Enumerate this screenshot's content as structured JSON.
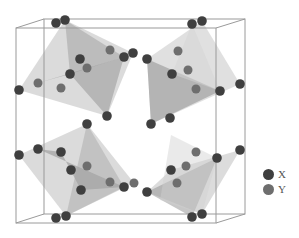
{
  "figure": {
    "type": "crystal-structure",
    "box": {
      "front": {
        "x1": 16,
        "y1": 28,
        "x2": 216,
        "y2": 223
      },
      "back": {
        "x1": 44,
        "y1": 19,
        "x2": 245,
        "y2": 214
      },
      "stroke": "#9a9a9a"
    },
    "polyhedra": [
      {
        "points": "65,20 133,53 107,116 19,90",
        "fill": "#bdbdbd",
        "opacity": 0.55
      },
      {
        "points": "65,20 124,57 70,74",
        "fill": "#9e9e9e",
        "opacity": 0.5
      },
      {
        "points": "38,83 124,57 107,116 70,74",
        "fill": "#8a8a8a",
        "opacity": 0.45
      },
      {
        "points": "202,21 240,84 151,124 147,59",
        "fill": "#c6c6c6",
        "opacity": 0.55
      },
      {
        "points": "147,59 220,91 151,124",
        "fill": "#8f8f8f",
        "opacity": 0.55
      },
      {
        "points": "192,24 220,91 172,74",
        "fill": "#d4d4d4",
        "opacity": 0.5
      },
      {
        "points": "87,124 134,183 66,216 19,155",
        "fill": "#bdbdbd",
        "opacity": 0.55
      },
      {
        "points": "38,149 124,187 81,190 61,152",
        "fill": "#8a8a8a",
        "opacity": 0.5
      },
      {
        "points": "87,124 124,187 66,216",
        "fill": "#a5a5a5",
        "opacity": 0.45
      },
      {
        "points": "171,170 240,150 202,214 147,192",
        "fill": "#c0c0c0",
        "opacity": 0.55
      },
      {
        "points": "147,192 217,158 192,217",
        "fill": "#8f8f8f",
        "opacity": 0.5
      },
      {
        "points": "171,135 217,158 202,214 160,200",
        "fill": "#d0d0d0",
        "opacity": 0.45
      }
    ],
    "atoms_x": [
      [
        56,
        23
      ],
      [
        65,
        20
      ],
      [
        80,
        59
      ],
      [
        70,
        74
      ],
      [
        19,
        90
      ],
      [
        124,
        57
      ],
      [
        133,
        53
      ],
      [
        107,
        116
      ],
      [
        147,
        59
      ],
      [
        172,
        74
      ],
      [
        220,
        91
      ],
      [
        240,
        84
      ],
      [
        151,
        124
      ],
      [
        170,
        118
      ],
      [
        192,
        24
      ],
      [
        202,
        21
      ],
      [
        19,
        155
      ],
      [
        38,
        149
      ],
      [
        87,
        124
      ],
      [
        61,
        152
      ],
      [
        71,
        170
      ],
      [
        81,
        190
      ],
      [
        124,
        187
      ],
      [
        56,
        218
      ],
      [
        66,
        216
      ],
      [
        147,
        192
      ],
      [
        171,
        170
      ],
      [
        217,
        158
      ],
      [
        240,
        150
      ],
      [
        192,
        217
      ],
      [
        202,
        214
      ]
    ],
    "atoms_y": [
      [
        110,
        50
      ],
      [
        87,
        68
      ],
      [
        38,
        83
      ],
      [
        61,
        88
      ],
      [
        178,
        51
      ],
      [
        188,
        70
      ],
      [
        196,
        89
      ],
      [
        87,
        166
      ],
      [
        110,
        182
      ],
      [
        134,
        183
      ],
      [
        196,
        152
      ],
      [
        186,
        166
      ],
      [
        177,
        183
      ]
    ],
    "colors": {
      "X": "#3f3f3f",
      "Y": "#6e6e6e"
    }
  },
  "legend": {
    "items": [
      {
        "label": "X",
        "color": "#3f3f3f"
      },
      {
        "label": "Y",
        "color": "#6e6e6e"
      }
    ]
  }
}
